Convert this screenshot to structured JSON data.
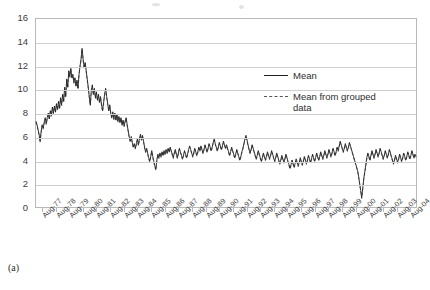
{
  "figure": {
    "panel_label": "(a)"
  },
  "legend": {
    "position": "inside-right",
    "entries": [
      {
        "label": "Mean",
        "style": "solid",
        "color": "#222222"
      },
      {
        "label": "Mean from grouped data",
        "style": "dashed",
        "color": "#555555"
      }
    ]
  },
  "chart_data": {
    "type": "line",
    "title": "",
    "subtitle": "",
    "xlabel": "",
    "ylabel": "",
    "grid": true,
    "ylim": [
      0,
      16
    ],
    "yticks": [
      0,
      2,
      4,
      6,
      8,
      10,
      12,
      14,
      16
    ],
    "ytick_labels": [
      "0",
      "2",
      "4",
      "6",
      "8",
      "10",
      "12",
      "14",
      "16"
    ],
    "xtick_labels": [
      "Aug-77",
      "Aug-78",
      "Aug-79",
      "Aug-80",
      "Aug-81",
      "Aug-82",
      "Aug-83",
      "Aug-84",
      "Aug-85",
      "Aug-86",
      "Aug-87",
      "Aug-88",
      "Aug-89",
      "Aug-90",
      "Aug-91",
      "Aug-92",
      "Aug-93",
      "Aug-94",
      "Aug-95",
      "Aug-96",
      "Aug-97",
      "Aug-98",
      "Aug-99",
      "Aug-00",
      "Aug-01",
      "Aug-02",
      "Aug-03",
      "Aug-04"
    ],
    "x_start": "Aug-77",
    "x_end": "Aug-05",
    "x_step_months": 1,
    "series": [
      {
        "name": "Mean",
        "style": "solid",
        "color": "#222222",
        "values": [
          7.3,
          7.0,
          6.6,
          6.2,
          5.6,
          6.4,
          7.0,
          6.7,
          7.2,
          7.6,
          7.1,
          7.6,
          8.0,
          7.5,
          8.2,
          7.8,
          8.5,
          8.0,
          8.6,
          8.1,
          8.8,
          8.3,
          9.0,
          8.4,
          9.3,
          8.7,
          9.6,
          9.0,
          10.2,
          9.4,
          10.9,
          10.2,
          11.6,
          11.1,
          11.8,
          11.0,
          11.3,
          10.6,
          11.0,
          10.3,
          10.8,
          10.1,
          11.3,
          12.0,
          12.6,
          13.5,
          12.6,
          11.9,
          12.3,
          11.6,
          10.9,
          10.2,
          9.4,
          8.7,
          9.9,
          10.4,
          9.6,
          10.1,
          9.3,
          9.8,
          9.1,
          9.6,
          8.9,
          9.4,
          8.7,
          8.2,
          8.9,
          9.6,
          10.1,
          9.4,
          8.8,
          8.2,
          8.7,
          8.0,
          7.6,
          8.1,
          7.5,
          8.0,
          7.4,
          7.9,
          7.3,
          7.7,
          7.2,
          7.6,
          7.0,
          7.4,
          6.9,
          7.3,
          7.6,
          7.0,
          6.5,
          6.0,
          5.6,
          6.0,
          5.5,
          5.1,
          5.4,
          5.0,
          5.4,
          5.8,
          5.3,
          5.8,
          6.2,
          5.7,
          6.1,
          5.6,
          5.1,
          4.7,
          5.0,
          4.6,
          4.2,
          3.9,
          4.3,
          4.8,
          4.3,
          3.9,
          3.5,
          3.2,
          4.0,
          4.5,
          4.2,
          4.6,
          4.3,
          4.7,
          4.4,
          4.8,
          4.5,
          4.9,
          4.6,
          5.0,
          4.7,
          5.1,
          4.8,
          4.5,
          4.2,
          4.6,
          4.9,
          4.5,
          4.2,
          4.6,
          5.0,
          4.7,
          4.4,
          4.1,
          4.4,
          4.8,
          4.5,
          4.2,
          4.5,
          4.9,
          5.2,
          4.9,
          4.6,
          4.3,
          4.6,
          5.0,
          4.7,
          4.4,
          4.7,
          5.1,
          4.8,
          5.2,
          4.9,
          4.6,
          4.9,
          5.3,
          5.0,
          4.7,
          5.0,
          5.4,
          5.1,
          4.8,
          5.1,
          5.5,
          5.8,
          5.4,
          5.1,
          4.8,
          5.1,
          5.5,
          5.2,
          4.9,
          5.2,
          5.6,
          5.3,
          5.0,
          5.3,
          5.0,
          4.7,
          4.4,
          4.7,
          5.1,
          4.8,
          4.5,
          4.2,
          4.5,
          4.9,
          4.6,
          4.3,
          4.0,
          4.3,
          4.7,
          5.0,
          5.4,
          5.8,
          6.1,
          5.7,
          5.3,
          4.9,
          4.6,
          4.9,
          5.3,
          5.0,
          4.7,
          4.4,
          4.1,
          4.4,
          4.8,
          4.5,
          4.2,
          3.9,
          4.2,
          4.6,
          4.3,
          4.0,
          4.3,
          4.7,
          4.4,
          4.1,
          4.4,
          4.8,
          4.5,
          4.2,
          3.9,
          4.2,
          4.6,
          4.3,
          4.0,
          3.7,
          4.0,
          4.4,
          4.1,
          3.8,
          4.1,
          4.5,
          4.2,
          3.9,
          3.6,
          3.3,
          3.6,
          4.0,
          3.7,
          3.4,
          3.7,
          4.1,
          3.8,
          3.5,
          3.8,
          4.2,
          3.9,
          3.6,
          3.9,
          4.3,
          4.0,
          3.7,
          4.0,
          4.4,
          4.1,
          3.8,
          4.1,
          4.5,
          4.2,
          3.9,
          4.2,
          4.6,
          4.3,
          4.0,
          4.3,
          4.7,
          4.4,
          4.1,
          4.4,
          4.8,
          4.5,
          4.2,
          4.5,
          4.9,
          4.6,
          4.3,
          4.6,
          5.0,
          4.7,
          4.4,
          4.7,
          5.1,
          4.8,
          5.2,
          5.6,
          5.3,
          5.0,
          4.7,
          5.0,
          5.4,
          5.1,
          4.8,
          5.1,
          5.5,
          5.2,
          4.9,
          4.6,
          4.3,
          4.0,
          3.7,
          3.4,
          3.1,
          2.6,
          2.0,
          1.4,
          0.8,
          1.6,
          2.4,
          3.0,
          3.6,
          4.2,
          4.6,
          4.3,
          4.0,
          4.4,
          4.8,
          4.5,
          4.2,
          4.5,
          4.9,
          4.6,
          4.3,
          4.6,
          5.0,
          4.7,
          4.4,
          4.1,
          4.4,
          4.8,
          4.5,
          4.2,
          4.5,
          4.9,
          4.6,
          4.3,
          4.0,
          3.7,
          4.0,
          4.4,
          4.1,
          3.8,
          4.1,
          4.5,
          4.2,
          3.9,
          4.2,
          4.6,
          4.3,
          4.0,
          4.3,
          4.7,
          4.4,
          4.1,
          4.4,
          4.8,
          4.5,
          4.2,
          4.5,
          4.3
        ]
      },
      {
        "name": "Mean from grouped data",
        "style": "dashed",
        "color": "#555555",
        "offset": -0.08
      }
    ]
  }
}
